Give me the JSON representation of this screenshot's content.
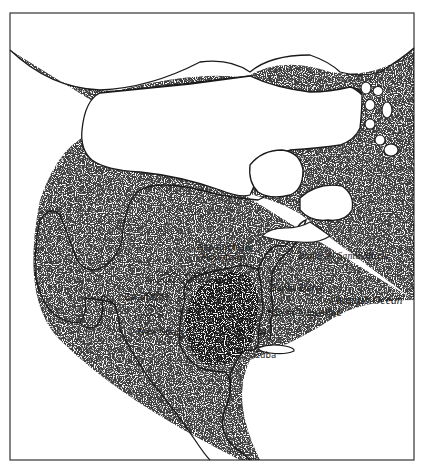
{
  "map": {
    "style": "hand-drawn stippled historical sketch map",
    "colors": {
      "ink": "#1a1a1a",
      "paper": "#ffffff",
      "frame": "#333333"
    },
    "labels": {
      "appalachian_line1": "Appalachian",
      "appalachian_line2": "Mountains",
      "bahia": "Bahia de Santa Mariá",
      "santa_elena": "Santa Elena",
      "atlantic": "Atlantic Ocean",
      "zacatecas": "Zacatecas",
      "saint_augustine": "Saint Augustine",
      "new_spain": "New Spain",
      "cuba": "Cuba"
    },
    "icons": [
      "mountain-range-icon",
      "settlement-marker-icon"
    ]
  }
}
